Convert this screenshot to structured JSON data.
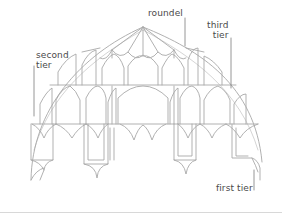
{
  "diagram": {
    "labels": {
      "roundel": "roundel",
      "third_tier": "third\ntier",
      "second_tier": "second\ntier",
      "first_tier": "first tier"
    },
    "colors": {
      "line": "#a8a8a8",
      "text": "#4a4a4a",
      "background": "#ffffff"
    }
  }
}
